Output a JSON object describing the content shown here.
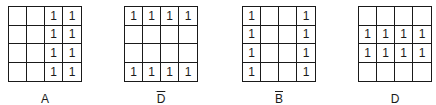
{
  "maps": [
    {
      "label": "A",
      "overbar": false,
      "cells": [
        [
          "",
          "",
          "1",
          "1"
        ],
        [
          "",
          "",
          "1",
          "1"
        ],
        [
          "",
          "",
          "1",
          "1"
        ],
        [
          "",
          "",
          "1",
          "1"
        ]
      ]
    },
    {
      "label": "D",
      "overbar": true,
      "cells": [
        [
          "1",
          "1",
          "1",
          "1"
        ],
        [
          "",
          "",
          "",
          ""
        ],
        [
          "",
          "",
          "",
          ""
        ],
        [
          "1",
          "1",
          "1",
          "1"
        ]
      ]
    },
    {
      "label": "B",
      "overbar": true,
      "cells": [
        [
          "1",
          "",
          "",
          "1"
        ],
        [
          "1",
          "",
          "",
          "1"
        ],
        [
          "1",
          "",
          "",
          "1"
        ],
        [
          "1",
          "",
          "",
          "1"
        ]
      ]
    },
    {
      "label": "D",
      "overbar": false,
      "cells": [
        [
          "",
          "",
          "",
          ""
        ],
        [
          "1",
          "1",
          "1",
          "1"
        ],
        [
          "1",
          "1",
          "1",
          "1"
        ],
        [
          "",
          "",
          "",
          ""
        ]
      ]
    }
  ]
}
